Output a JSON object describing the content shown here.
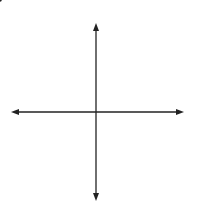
{
  "chart_data": {
    "type": "line",
    "title": "",
    "xlabel": "x",
    "ylabel": "y",
    "xlim": [
      -120,
      120
    ],
    "ylim": [
      -120,
      120
    ],
    "grid": true,
    "grid_step": 20,
    "x_tick_labels": [
      "20",
      "40",
      "60",
      "80",
      "100"
    ],
    "y_tick_labels": [
      "20",
      "40",
      "60",
      "80",
      "100"
    ],
    "x_ticks": [
      20,
      40,
      60,
      80,
      100
    ],
    "y_ticks": [
      20,
      40,
      60,
      80,
      100
    ],
    "series": [
      {
        "name": "-4x + 10y = 100",
        "equation": "-4x + 10y = 100",
        "slope": 0.4,
        "intercept": 10,
        "x": [
          -110,
          115
        ],
        "y": [
          -34,
          56
        ],
        "arrows": "both"
      }
    ],
    "points": [
      {
        "label": "y-intercept",
        "x": 0,
        "y": 10
      }
    ],
    "annotations": [
      "−4x + 10y = 100"
    ],
    "colors": {
      "line": "#222222",
      "grid": "#c8c8c8",
      "axis": "#222222"
    }
  },
  "labels": {
    "x_axis": "x",
    "y_axis": "y",
    "equation": "−4x + 10y = 100",
    "x_ticks": [
      "20",
      "40",
      "60",
      "80",
      "100"
    ],
    "y_ticks": [
      "100",
      "80",
      "60",
      "40",
      "20"
    ]
  }
}
